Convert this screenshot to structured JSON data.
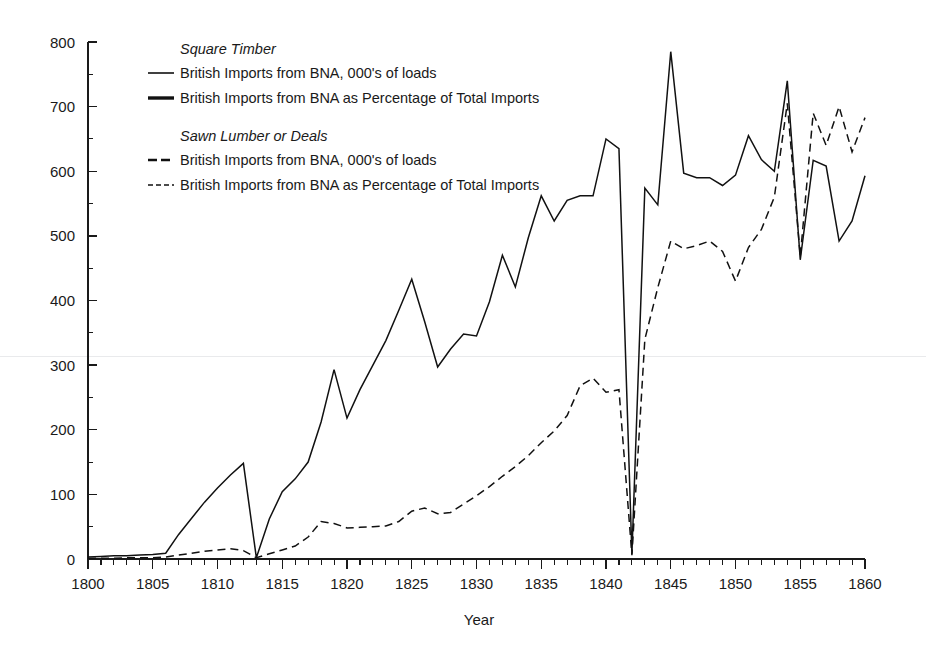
{
  "figure": {
    "background_color": "#ffffff",
    "ink_color": "#111111"
  },
  "legend": {
    "position": "top-left-inside",
    "groups": [
      {
        "title": "Square Timber",
        "entries": [
          {
            "style": "solid-thin",
            "label": "British Imports from BNA, 000's of loads"
          },
          {
            "style": "solid-thick",
            "label": "British Imports from BNA as Percentage of Total Imports"
          }
        ]
      },
      {
        "title": "Sawn Lumber or Deals",
        "entries": [
          {
            "style": "dashed-long",
            "label": "British Imports from BNA, 000's of loads"
          },
          {
            "style": "dashed-short",
            "label": "British Imports from BNA as Percentage of Total Imports"
          }
        ]
      }
    ]
  },
  "chart_data": {
    "type": "line",
    "title": "",
    "subtitle": "",
    "xlabel": "Year",
    "ylabel": "",
    "xlim": [
      1800,
      1860
    ],
    "ylim": [
      0,
      800
    ],
    "grid": false,
    "x_major_step": 5,
    "x_minor_step": 1,
    "y_major_step": 100,
    "y_minor_step": 50,
    "xticks": [
      1800,
      1805,
      1810,
      1815,
      1820,
      1825,
      1830,
      1835,
      1840,
      1845,
      1850,
      1855,
      1860
    ],
    "xticklabels": [
      "1800",
      "1805",
      "1810",
      "1815",
      "1820",
      "1825",
      "1830",
      "1835",
      "1840",
      "1845",
      "1850",
      "1855",
      "1860"
    ],
    "yticks": [
      0,
      100,
      200,
      300,
      400,
      500,
      600,
      700,
      800
    ],
    "yticklabels": [
      "0",
      "100",
      "200",
      "300",
      "400",
      "500",
      "600",
      "700",
      "800"
    ],
    "x": [
      1800,
      1801,
      1802,
      1803,
      1804,
      1805,
      1806,
      1807,
      1808,
      1809,
      1810,
      1811,
      1812,
      1813,
      1814,
      1815,
      1816,
      1817,
      1818,
      1819,
      1820,
      1821,
      1822,
      1823,
      1824,
      1825,
      1826,
      1827,
      1828,
      1829,
      1830,
      1831,
      1832,
      1833,
      1834,
      1835,
      1836,
      1837,
      1838,
      1839,
      1840,
      1841,
      1842,
      1843,
      1844,
      1845,
      1846,
      1847,
      1848,
      1849,
      1850,
      1851,
      1852,
      1853,
      1854,
      1855,
      1856,
      1857,
      1858,
      1859,
      1860
    ],
    "series": [
      {
        "name": "Square Timber — British Imports from BNA, 000's of loads",
        "style": "solid",
        "values": [
          3,
          4,
          5,
          5,
          6,
          7,
          9,
          38,
          63,
          88,
          110,
          130,
          148,
          2,
          62,
          104,
          124,
          150,
          212,
          293,
          218,
          262,
          300,
          338,
          385,
          433,
          367,
          297,
          325,
          348,
          345,
          398,
          470,
          421,
          497,
          562,
          523,
          555,
          562,
          562,
          650,
          635,
          8,
          574,
          548,
          785,
          597,
          590,
          590,
          578,
          594,
          655,
          618,
          600,
          740,
          463,
          617,
          608,
          492,
          523,
          593
        ]
      },
      {
        "name": "Sawn Lumber or Deals — British Imports from BNA, 000's of loads",
        "style": "dashed",
        "values": [
          1,
          1,
          1,
          2,
          2,
          2,
          3,
          6,
          9,
          12,
          14,
          16,
          13,
          2,
          8,
          14,
          20,
          34,
          58,
          55,
          48,
          49,
          50,
          51,
          58,
          74,
          79,
          70,
          72,
          85,
          98,
          112,
          128,
          143,
          160,
          180,
          198,
          222,
          268,
          280,
          258,
          262,
          6,
          340,
          420,
          492,
          480,
          485,
          492,
          476,
          430,
          482,
          510,
          560,
          705,
          468,
          690,
          640,
          700,
          630,
          683
        ]
      }
    ],
    "annotations": [
      {
        "x": 1813,
        "text": "Both series collapse to near zero (War of 1812 disruption)"
      },
      {
        "x": 1842,
        "text": "Both series collapse to near zero (1842 tariff / trade crash)"
      },
      {
        "x": 1845,
        "text": "Square timber peak, 785 thousand loads"
      }
    ]
  }
}
